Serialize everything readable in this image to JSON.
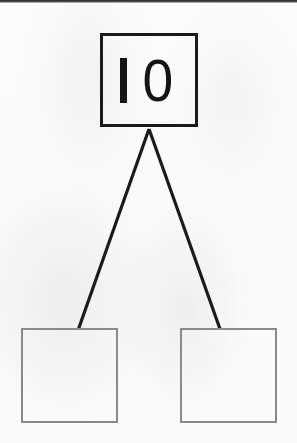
{
  "document": {
    "kind": "number-bond-worksheet",
    "background_color": "#fbfbfb"
  },
  "diagram": {
    "title": "",
    "whole": {
      "label": "10",
      "digit_one": "1",
      "digit_zero": "0",
      "border_color": "#1b1b1b",
      "text_color": "#141414"
    },
    "parts": [
      {
        "label": "",
        "placeholder": "",
        "border_color": "#8a8a8a"
      },
      {
        "label": "",
        "placeholder": "",
        "border_color": "#8a8a8a"
      }
    ],
    "connectors": {
      "color": "#1b1b1b",
      "count": 2,
      "origin": "whole-box-bottom-center",
      "targets": "part-box-top-edges"
    }
  }
}
